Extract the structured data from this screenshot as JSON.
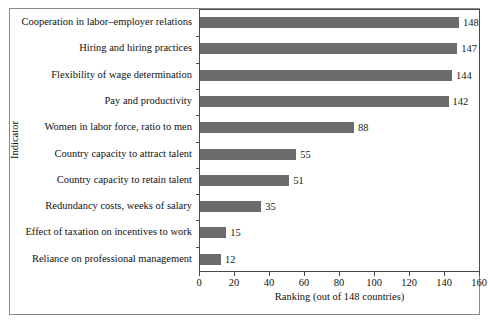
{
  "chart_data": {
    "type": "bar",
    "orientation": "horizontal",
    "title": "",
    "xlabel": "Ranking (out of 148 countries)",
    "ylabel": "Indicator",
    "xlim": [
      0,
      160
    ],
    "xticks": [
      0,
      20,
      40,
      60,
      80,
      100,
      120,
      140,
      160
    ],
    "xtick_labels": [
      "0",
      "20",
      "40",
      "60",
      "80",
      "100",
      "120",
      "140",
      "160"
    ],
    "grid": false,
    "legend": "none",
    "bar_color": "#6b6b6b",
    "categories": [
      "Cooperation in labor–employer relations",
      "Hiring and hiring practices",
      "Flexibility of wage determination",
      "Pay and productivity",
      "Women in labor force, ratio to men",
      "Country capacity to attract talent",
      "Country capacity to retain talent",
      "Redundancy costs, weeks of salary",
      "Effect of taxation on incentives to work",
      "Reliance on professional management"
    ],
    "values": [
      148,
      147,
      144,
      142,
      88,
      55,
      51,
      35,
      15,
      12
    ],
    "value_labels": [
      "148",
      "147",
      "144",
      "142",
      "88",
      "55",
      "51",
      "35",
      "15",
      "12"
    ]
  }
}
